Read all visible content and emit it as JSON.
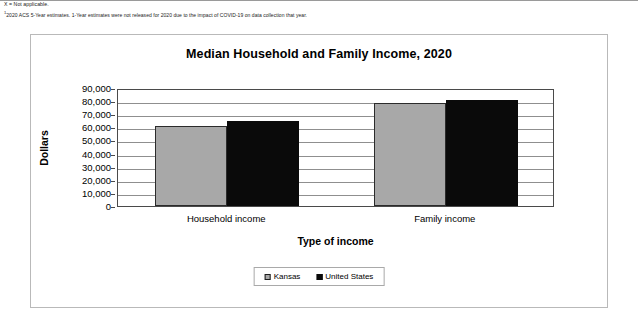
{
  "notes": {
    "not_applicable": "X = Not applicable.",
    "footnote_marker": "1",
    "footnote": "2020 ACS 5-Year estimates. 1-Year estimates were not released for 2020 due to the impact of COVID-19 on data collection that year."
  },
  "chart_data": {
    "type": "bar",
    "title": "Median Household and Family Income, 2020",
    "xlabel": "Type of income",
    "ylabel": "Dollars",
    "categories": [
      "Household income",
      "Family income"
    ],
    "series": [
      {
        "name": "Kansas",
        "color": "#a8a8a8",
        "values": [
          61000,
          78500
        ]
      },
      {
        "name": "United States",
        "color": "#0a0a0a",
        "values": [
          65000,
          81000
        ]
      }
    ],
    "ylim": [
      0,
      90000
    ],
    "ytick_step": 10000,
    "ytick_labels": [
      "0",
      "10,000",
      "20,000",
      "30,000",
      "40,000",
      "50,000",
      "60,000",
      "70,000",
      "80,000",
      "90,000"
    ],
    "grid": true,
    "legend_position": "bottom"
  }
}
